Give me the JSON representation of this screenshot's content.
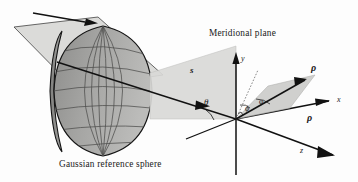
{
  "figure": {
    "domain": "optics-diagram",
    "background_color": "#fdfdfd",
    "width": 358,
    "height": 182,
    "ink_color": "#1a1a1a"
  },
  "captions": {
    "meridional_plane": "Meridional plane",
    "gaussian_reference_sphere": "Gaussian reference sphere"
  },
  "axes": {
    "x_label": "x",
    "y_label": "y",
    "z_label": "z"
  },
  "vectors": {
    "ray_direction": "s",
    "rho_upper": "ρ",
    "rho_lower": "ρ"
  },
  "angles": {
    "theta": "θ",
    "phi": "ϕ",
    "varphi": "φ"
  },
  "elements": {
    "incoming_beam": "incoming-beam-parallelogram",
    "sphere_cap": "gaussian-reference-sphere-cap",
    "sphere_rim": "sphere-rim-ellipse",
    "meridional_plane_surface": "meridional-plane-quad",
    "tilted_plane_surface": "tilted-rho-plane-quad",
    "beam_arrow": "beam-direction-arrow"
  },
  "colors": {
    "beam_fill": "#d8d8d6",
    "sphere_fill": "#a9a9a7",
    "sphere_shade": "#8f8f8d",
    "plane_fill": "#d6d6d4",
    "tilt_plane_fill": "#c9c9c7",
    "line": "#1a1a1a",
    "grid_line": "#5a5a58"
  }
}
